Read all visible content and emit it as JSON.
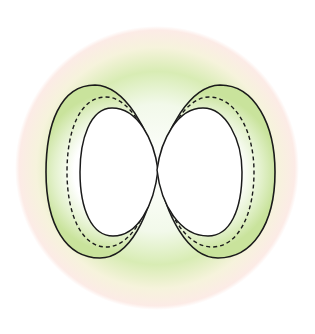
{
  "diagram": {
    "type": "two-lobe orbital / contour diagram",
    "colors": {
      "halo_outer": "#fbe9e4",
      "halo_green": "#d6ebb0",
      "lobe_fill": "#cfe6a4",
      "inner_fill": "#ffffff",
      "stroke": "#1a1a1a"
    },
    "lobes": [
      {
        "side": "left",
        "contours": [
          "outer-solid",
          "middle-dashed",
          "inner-solid"
        ]
      },
      {
        "side": "right",
        "contours": [
          "outer-solid",
          "middle-dashed",
          "inner-solid"
        ]
      }
    ]
  }
}
